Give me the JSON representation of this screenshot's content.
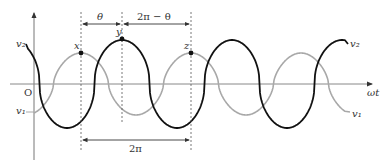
{
  "header_cut_text": "",
  "diagram": {
    "axis": {
      "x_label": "ωt",
      "origin_label": "O"
    },
    "signals": [
      {
        "name": "v1",
        "label": "v₁",
        "color": "#a8a8a8",
        "description": "reference wave, lighter gray"
      },
      {
        "name": "v2",
        "label": "v₂",
        "color": "#111111",
        "description": "wave leading v1, darker black"
      }
    ],
    "points": [
      {
        "id": "x",
        "label": "x",
        "on": "v1"
      },
      {
        "id": "y",
        "label": "y",
        "on": "v2"
      },
      {
        "id": "z",
        "label": "z",
        "on": "v1"
      }
    ],
    "dimensions": {
      "theta": "θ",
      "two_pi_minus_theta": "2π − θ",
      "two_pi": "2π"
    },
    "phase_relation": {
      "period": "2π",
      "lag_of_v2_after_x": "θ",
      "remaining": "2π − θ"
    },
    "colors": {
      "v1": "#a8a8a8",
      "v2": "#111111",
      "axis": "#777777",
      "dash": "#555555"
    }
  }
}
